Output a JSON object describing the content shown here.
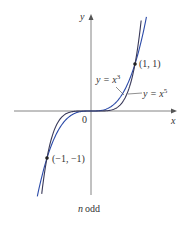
{
  "chart_data": {
    "type": "line",
    "title": "",
    "caption": "n odd",
    "xlabel": "x",
    "ylabel": "y",
    "origin_label": "0",
    "series": [
      {
        "name": "y = x^3",
        "label_base": "y = x",
        "exponent": "3",
        "color": "#2b4aa8",
        "x": [
          -1.6,
          -1,
          -0.5,
          0,
          0.5,
          1,
          1.6
        ],
        "y": [
          -4.096,
          -1,
          -0.125,
          0,
          0.125,
          1,
          4.096
        ]
      },
      {
        "name": "y = x^5",
        "label_base": "y = x",
        "exponent": "5",
        "color": "#3a3a5a",
        "x": [
          -1.35,
          -1,
          -0.5,
          0,
          0.5,
          1,
          1.35
        ],
        "y": [
          -4.48,
          -1,
          -0.03125,
          0,
          0.03125,
          1,
          4.48
        ]
      }
    ],
    "points": [
      {
        "label": "(1, 1)",
        "x": 1,
        "y": 1
      },
      {
        "label": "(−1, −1)",
        "x": -1,
        "y": -1
      }
    ],
    "grid": false,
    "legend": "none"
  }
}
